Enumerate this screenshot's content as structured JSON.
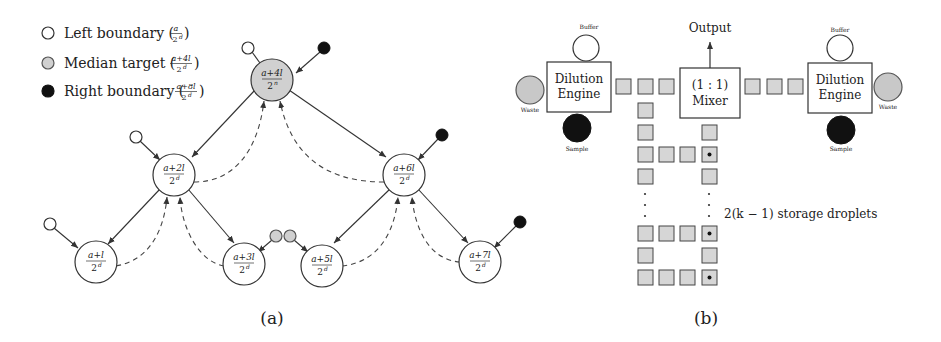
{
  "legend": {
    "items": [
      {
        "label": "Left boundary (a/2^d)",
        "text": "Left boundary (",
        "num": "a",
        "den": "2",
        "sup": "d",
        "fill": "#ffffff"
      },
      {
        "label": "Median target ((a+4l)/2^d)",
        "text": "Median target (",
        "num": "a+4l",
        "den": "2",
        "sup": "d",
        "fill": "#d0d0d0"
      },
      {
        "label": "Right boundary ((a+8l)/2^d)",
        "text": "Right boundary (",
        "num": "a+8l",
        "den": "2",
        "sup": "d",
        "fill": "#111111"
      }
    ]
  },
  "tree": {
    "root": {
      "num": "a+4l",
      "den": "2",
      "sup": "n"
    },
    "level2": [
      {
        "num": "a+2l",
        "den": "2",
        "sup": "d"
      },
      {
        "num": "a+6l",
        "den": "2",
        "sup": "d"
      }
    ],
    "level3": [
      {
        "num": "a+l",
        "den": "2",
        "sup": "d"
      },
      {
        "num": "a+3l",
        "den": "2",
        "sup": "d"
      },
      {
        "num": "a+5l",
        "den": "2",
        "sup": "d"
      },
      {
        "num": "a+7l",
        "den": "2",
        "sup": "d"
      }
    ]
  },
  "engine_left": {
    "title_line1": "Dilution",
    "title_line2": "Engine",
    "buffer": "Buffer",
    "waste": "Waste",
    "sample": "Sample"
  },
  "engine_right": {
    "title_line1": "Dilution",
    "title_line2": "Engine",
    "buffer": "Buffer",
    "waste": "Waste",
    "sample": "Sample"
  },
  "mixer": {
    "line1": "(1 : 1)",
    "line2": "Mixer",
    "output": "Output"
  },
  "storage_label": "2(k − 1) storage droplets",
  "captions": {
    "a": "(a)",
    "b": "(b)"
  },
  "colors": {
    "line": "#333333",
    "gray_fill": "#d0d0d0",
    "black_fill": "#111111",
    "square_fill": "#d6d6d6"
  }
}
